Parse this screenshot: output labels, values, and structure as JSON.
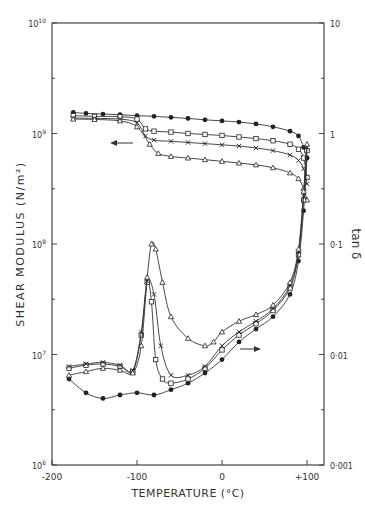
{
  "chart_data": {
    "type": "line",
    "title": "",
    "xlabel": "TEMPERATURE (°C)",
    "ylabel": "SHEAR MODULUS (N/m²)",
    "y2label": "tan δ",
    "xlim": [
      -200,
      120
    ],
    "ylim": [
      1000000.0,
      10000000000.0
    ],
    "y2lim": [
      0.001,
      10
    ],
    "yscale": "log",
    "y2scale": "log",
    "grid": false,
    "legend": "none",
    "x_ticks": [
      "-200",
      "-100",
      "0",
      "+100"
    ],
    "y_ticks": [
      "10^6",
      "10^7",
      "10^8",
      "10^9",
      "10^10"
    ],
    "y2_ticks": [
      "0.001",
      "0.01",
      "0.1",
      "1",
      "10"
    ],
    "annotations": [
      {
        "type": "arrow",
        "direction": "left",
        "meaning": "modulus curves read on left axis",
        "x": -115,
        "y": 850000000.0
      },
      {
        "type": "arrow",
        "direction": "right",
        "meaning": "tan delta curves read on right axis",
        "x": 20,
        "y_tan": 0.009
      }
    ],
    "series": [
      {
        "name": "modulus-filled-circle",
        "marker": "filled-circle",
        "axis": "left",
        "x": [
          -175,
          -160,
          -140,
          -120,
          -100,
          -80,
          -60,
          -40,
          -20,
          0,
          20,
          40,
          60,
          80,
          90,
          96,
          100
        ],
        "values": [
          1550000000.0,
          1520000000.0,
          1500000000.0,
          1480000000.0,
          1450000000.0,
          1430000000.0,
          1400000000.0,
          1370000000.0,
          1330000000.0,
          1300000000.0,
          1270000000.0,
          1220000000.0,
          1150000000.0,
          1050000000.0,
          950000000.0,
          750000000.0,
          600000000.0
        ]
      },
      {
        "name": "modulus-open-square",
        "marker": "open-square",
        "axis": "left",
        "x": [
          -175,
          -150,
          -120,
          -100,
          -90,
          -80,
          -60,
          -40,
          -20,
          0,
          20,
          40,
          60,
          80,
          90,
          96,
          100
        ],
        "values": [
          1450000000.0,
          1430000000.0,
          1420000000.0,
          1350000000.0,
          1100000000.0,
          1050000000.0,
          1030000000.0,
          1000000000.0,
          980000000.0,
          960000000.0,
          930000000.0,
          900000000.0,
          860000000.0,
          800000000.0,
          720000000.0,
          600000000.0,
          400000000.0
        ]
      },
      {
        "name": "modulus-cross",
        "marker": "cross",
        "axis": "left",
        "x": [
          -175,
          -150,
          -120,
          -100,
          -90,
          -80,
          -60,
          -40,
          -20,
          0,
          20,
          40,
          60,
          80,
          90,
          96,
          100
        ],
        "values": [
          1380000000.0,
          1370000000.0,
          1350000000.0,
          1250000000.0,
          950000000.0,
          870000000.0,
          850000000.0,
          830000000.0,
          810000000.0,
          790000000.0,
          770000000.0,
          740000000.0,
          700000000.0,
          640000000.0,
          570000000.0,
          480000000.0,
          350000000.0
        ]
      },
      {
        "name": "modulus-open-triangle",
        "marker": "open-triangle",
        "axis": "left",
        "x": [
          -175,
          -150,
          -120,
          -100,
          -85,
          -75,
          -60,
          -40,
          -20,
          0,
          20,
          40,
          60,
          80,
          90,
          96,
          100
        ],
        "values": [
          1350000000.0,
          1340000000.0,
          1300000000.0,
          1150000000.0,
          800000000.0,
          660000000.0,
          620000000.0,
          600000000.0,
          580000000.0,
          560000000.0,
          540000000.0,
          520000000.0,
          490000000.0,
          440000000.0,
          390000000.0,
          320000000.0,
          250000000.0
        ]
      },
      {
        "name": "tan-delta-filled-circle",
        "marker": "filled-circle",
        "axis": "right",
        "x": [
          -180,
          -160,
          -140,
          -120,
          -100,
          -80,
          -60,
          -40,
          -20,
          0,
          20,
          40,
          60,
          80,
          90,
          96,
          100
        ],
        "values": [
          0.006,
          0.0045,
          0.004,
          0.0043,
          0.0045,
          0.0043,
          0.0048,
          0.0055,
          0.0068,
          0.009,
          0.013,
          0.017,
          0.022,
          0.035,
          0.07,
          0.2,
          0.6
        ]
      },
      {
        "name": "tan-delta-open-square",
        "marker": "open-square",
        "axis": "right",
        "x": [
          -180,
          -160,
          -140,
          -120,
          -105,
          -95,
          -88,
          -83,
          -78,
          -70,
          -60,
          -40,
          -20,
          0,
          20,
          40,
          60,
          80,
          90,
          96,
          100
        ],
        "values": [
          0.0075,
          0.008,
          0.0082,
          0.0078,
          0.007,
          0.015,
          0.045,
          0.03,
          0.009,
          0.006,
          0.0055,
          0.006,
          0.0075,
          0.011,
          0.015,
          0.019,
          0.025,
          0.04,
          0.08,
          0.25,
          0.7
        ]
      },
      {
        "name": "tan-delta-cross",
        "marker": "cross",
        "axis": "right",
        "x": [
          -180,
          -160,
          -140,
          -120,
          -105,
          -95,
          -88,
          -80,
          -72,
          -60,
          -40,
          -20,
          0,
          20,
          40,
          60,
          80,
          90,
          96,
          100
        ],
        "values": [
          0.0078,
          0.0082,
          0.0085,
          0.008,
          0.0072,
          0.016,
          0.046,
          0.035,
          0.012,
          0.0065,
          0.0065,
          0.0078,
          0.012,
          0.016,
          0.02,
          0.026,
          0.042,
          0.085,
          0.27,
          0.75
        ]
      },
      {
        "name": "tan-delta-open-triangle",
        "marker": "open-triangle",
        "axis": "right",
        "x": [
          -180,
          -160,
          -140,
          -120,
          -105,
          -95,
          -88,
          -83,
          -78,
          -70,
          -60,
          -40,
          -20,
          -10,
          0,
          20,
          40,
          60,
          80,
          90,
          96,
          100
        ],
        "values": [
          0.0065,
          0.007,
          0.0075,
          0.0072,
          0.0068,
          0.012,
          0.05,
          0.1,
          0.09,
          0.045,
          0.022,
          0.014,
          0.012,
          0.013,
          0.016,
          0.02,
          0.023,
          0.028,
          0.045,
          0.09,
          0.3,
          0.8
        ]
      }
    ]
  },
  "axes": {
    "x_title": "TEMPERATURE (°C)",
    "y_title": "SHEAR MODULUS",
    "y_unit": "(N/m²)",
    "y2_title": "tan δ",
    "x_ticks": [
      "-200",
      "-100",
      "0",
      "+100"
    ],
    "y_ticks": [
      "10",
      "10",
      "10",
      "10",
      "10"
    ],
    "y_exps": [
      "6",
      "7",
      "8",
      "9",
      "10"
    ],
    "y2_ticks": [
      "0·001",
      "0·01",
      "0·1",
      "1",
      "10"
    ]
  }
}
